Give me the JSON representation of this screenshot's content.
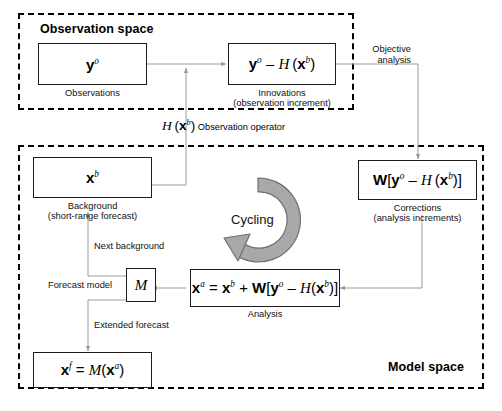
{
  "diagram": {
    "colors": {
      "stroke": "#1b1b1b",
      "wire": "#9a9a9a",
      "cycle_fill": "#a8a8a8",
      "cycle_stroke": "#6e6e6e",
      "background": "#ffffff"
    },
    "regions": [
      {
        "id": "observation-space",
        "label": "Observation space"
      },
      {
        "id": "model-space",
        "label": "Model space"
      }
    ],
    "nodes": [
      {
        "id": "observations",
        "formula_html": "<span class=\"bf\">y</span><sup class=\"it\">o</sup>",
        "formula_text": "y^o",
        "caption": "Observations"
      },
      {
        "id": "innovations",
        "formula_html": "<span class=\"bf\">y</span><sup class=\"it\">o</sup> &#8211; <span class=\"it\">H</span>&#8201;(<span class=\"bf\">x</span><sup class=\"it\">b</sup>)",
        "formula_text": "y^o - H (x^b)",
        "caption": "Innovations",
        "caption2": "(observation increment)"
      },
      {
        "id": "background",
        "formula_html": "<span class=\"bf\">x</span><sup class=\"it\">b</sup>",
        "formula_text": "x^b",
        "caption": "Background",
        "caption2": "(short-range forecast)"
      },
      {
        "id": "corrections",
        "formula_html": "<span class=\"bf\">W</span>[<span class=\"bf\">y</span><sup class=\"it\">o</sup> &#8211; <span class=\"it\">H</span>&#8201;(<span class=\"bf\">x</span><sup class=\"it\">b</sup>)]",
        "formula_text": "W[y^o - H (x^b)]",
        "caption": "Corrections",
        "caption2": "(analysis increments)"
      },
      {
        "id": "analysis",
        "formula_html": "<span class=\"bf\">x</span><sup class=\"it\">a</sup> = <span class=\"bf\">x</span><sup class=\"it\">b</sup> + <span class=\"bf\">W</span>[<span class=\"bf\">y</span><sup class=\"it\">o</sup> &#8211; <span class=\"it\">H</span>(<span class=\"bf\">x</span><sup class=\"it\">b</sup>)]",
        "formula_text": "x^a = x^b + W[y^o - H(x^b)]",
        "caption": "Analysis"
      },
      {
        "id": "forecast-model",
        "formula_html": "<span class=\"it\">M</span>",
        "formula_text": "M",
        "caption": ""
      },
      {
        "id": "forecast",
        "formula_html": "<span class=\"bf\">x</span><sup class=\"it\">f</sup> = <span class=\"it\">M</span>(<span class=\"bf\">x</span><sup class=\"it\">a</sup>)",
        "formula_text": "x^f = M(x^a)",
        "caption": ""
      }
    ],
    "edge_labels": [
      {
        "id": "objective-analysis",
        "line1": "Objective",
        "line2": "analysis"
      },
      {
        "id": "observation-operator",
        "math_html": "<span class=\"it\">H</span>&#8201;(<span class=\"bf\">x</span><sup class=\"it\">b</sup>)",
        "math_text": "H (x^b)",
        "text": "Observation operator"
      },
      {
        "id": "next-background",
        "text": "Next background"
      },
      {
        "id": "forecast-model-label",
        "text": "Forecast model"
      },
      {
        "id": "extended-forecast",
        "text": "Extended forecast"
      }
    ],
    "cycle": {
      "id": "cycling",
      "label": "Cycling"
    }
  }
}
